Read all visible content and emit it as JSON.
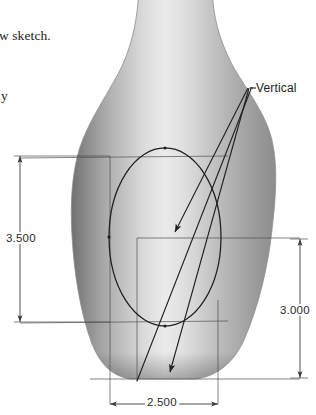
{
  "page": {
    "background_color": "#ffffff",
    "width": 316,
    "height": 415
  },
  "document_text": {
    "line_1": "new sketch.",
    "line_2": "ely"
  },
  "annotation": {
    "vertical_label": "Vertical",
    "leader_anchor": {
      "x": 250,
      "y": 88
    },
    "leader_targets": [
      {
        "name": "ellipse-center",
        "x": 168,
        "y": 238,
        "arrow": true
      },
      {
        "name": "vase-bottom",
        "x": 168,
        "y": 378,
        "arrow": true
      },
      {
        "name": "ellipse-edge",
        "x": 137,
        "y": 380,
        "arrow": false
      }
    ]
  },
  "dimensions": {
    "left": {
      "value": "3.500",
      "orientation": "vertical",
      "line_x": 20,
      "y_start": 155,
      "y_end": 326
    },
    "right": {
      "value": "3.000",
      "orientation": "vertical",
      "line_x": 300,
      "y_start": 238,
      "y_end": 378
    },
    "bottom": {
      "value": "2.500",
      "orientation": "horizontal",
      "line_y": 404,
      "x_start": 110,
      "x_end": 218
    }
  },
  "geometry": {
    "vase": {
      "name": "revolved-vase-solid",
      "fill_light": "#f1f1f1",
      "fill_mid": "#b8b8b8",
      "fill_dark": "#6e6e6e",
      "outline_color": "#8a8a8a",
      "neck_top_left_x": 138,
      "neck_top_right_x": 213,
      "body_left_x": 72,
      "body_right_x": 285,
      "body_bottom_y": 380
    },
    "sketch_ellipse": {
      "name": "profile-ellipse",
      "center_x": 165,
      "center_y": 237,
      "radius_x": 56,
      "radius_y": 89,
      "stroke_color": "#1f1f1f"
    },
    "construction_lines": {
      "stroke_color": "#5a5a5a",
      "horizontal_y": [
        158,
        238,
        322,
        378
      ],
      "vertical_x": [
        110,
        137,
        218
      ]
    }
  },
  "colors": {
    "line": "#1f1f1f",
    "dim_line": "#555555",
    "text": "#1b1b1b"
  }
}
